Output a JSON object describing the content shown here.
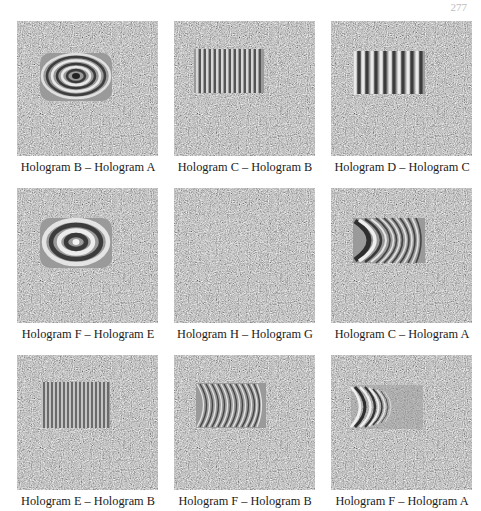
{
  "page": {
    "number": "277"
  },
  "figure": {
    "panels": [
      {
        "caption": "Hologram B – Hologram A",
        "pattern": "rings-fine"
      },
      {
        "caption": "Hologram C – Hologram B",
        "pattern": "vertical-fringes-fine"
      },
      {
        "caption": "Hologram D – Hologram C",
        "pattern": "vertical-fringes-coarse"
      },
      {
        "caption": "Hologram F – Hologram E",
        "pattern": "rings-coarse"
      },
      {
        "caption": "Hologram H – Hologram G",
        "pattern": "noise-only"
      },
      {
        "caption": "Hologram C – Hologram A",
        "pattern": "curved-fringes-left"
      },
      {
        "caption": "Hologram E – Hologram B",
        "pattern": "vertical-fringes-dense"
      },
      {
        "caption": "Hologram F – Hologram B",
        "pattern": "curved-fringes-dense"
      },
      {
        "caption": "Hologram F – Hologram A",
        "pattern": "curved-fringes-compact"
      }
    ]
  }
}
